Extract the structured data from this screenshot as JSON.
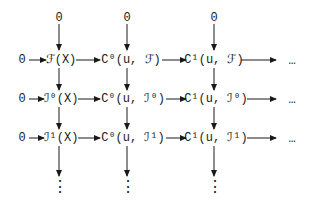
{
  "diagram": {
    "type": "commutative-diagram",
    "top_zeros": [
      "0",
      "0",
      "0"
    ],
    "rows": [
      {
        "left": "0",
        "nodes": [
          "ℱ(X)",
          "C⁰(u, ℱ)",
          "C¹(u, ℱ)"
        ],
        "right": "…"
      },
      {
        "left": "0",
        "nodes": [
          "ℐ⁰(X)",
          "C⁰(u, ℐ⁰)",
          "C¹(u, ℐ⁰)"
        ],
        "right": "…"
      },
      {
        "left": "0",
        "nodes": [
          "ℐ¹(X)",
          "C⁰(u, ℐ¹)",
          "C¹(u, ℐ¹)"
        ],
        "right": "…"
      }
    ],
    "bottom_continuations": [
      "⋮",
      "⋮",
      "⋮"
    ]
  }
}
